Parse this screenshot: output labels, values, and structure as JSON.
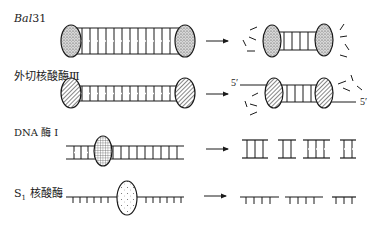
{
  "rows": [
    {
      "id": "bal31",
      "label_italic": "Bal",
      "label_rest": "31"
    },
    {
      "id": "exo3",
      "label": "外切核酸酶Ⅲ",
      "end_labels": [
        "5′",
        "5′"
      ]
    },
    {
      "id": "dnase1",
      "label": "DNA 酶 Ⅰ"
    },
    {
      "id": "s1",
      "label_main": "S",
      "label_sub": "1",
      "label_rest": " 核酸酶"
    }
  ],
  "arrow_glyph": "→",
  "colors": {
    "ink": "#1a1a1a",
    "background": "#ffffff"
  }
}
